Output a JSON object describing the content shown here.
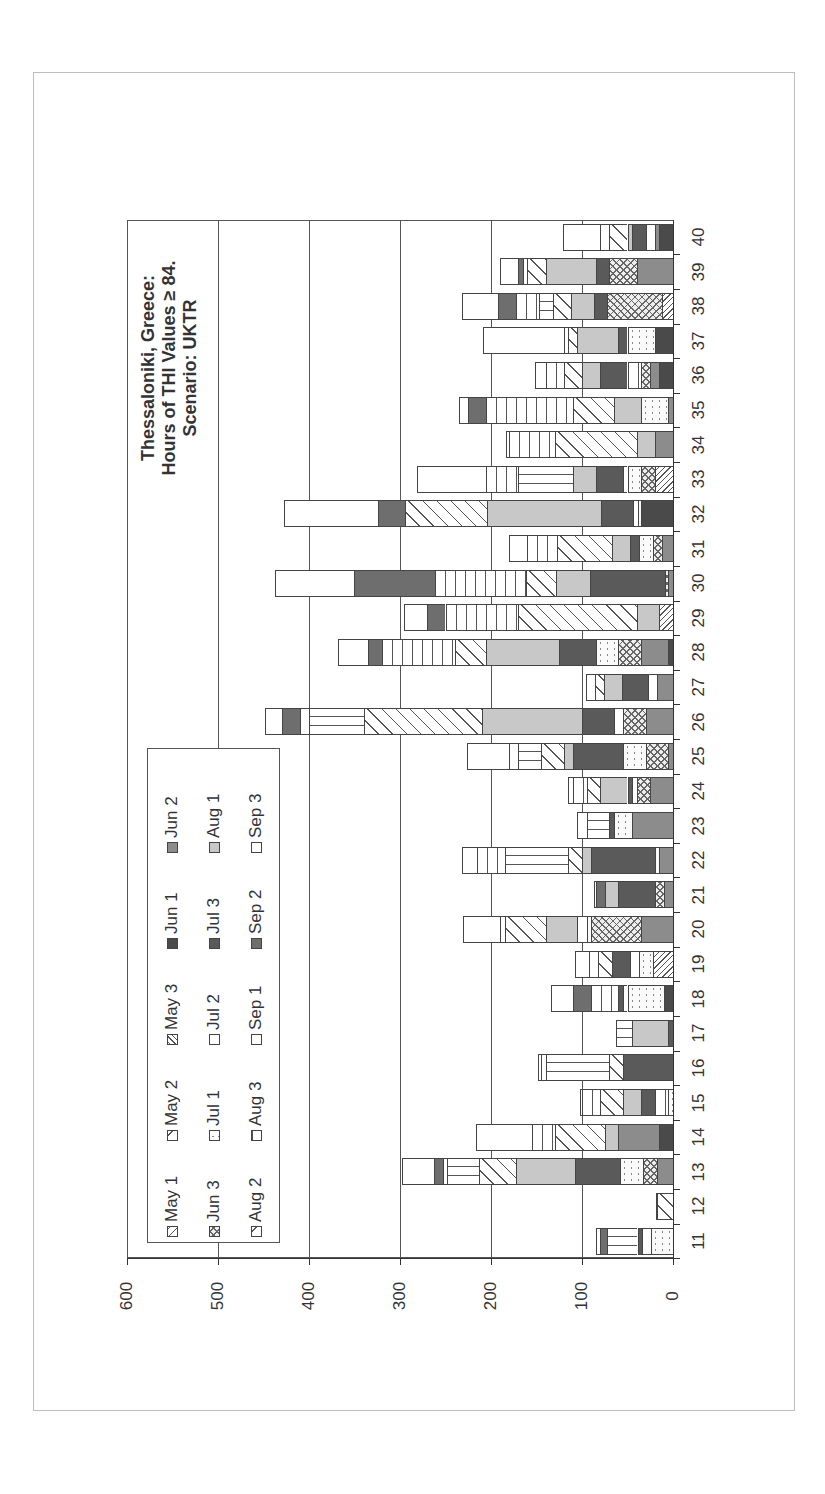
{
  "chart_data": {
    "type": "bar",
    "orientation": "stacked bar, page rotated 90° counter-clockwise",
    "title": "Thessaloniki, Greece: Hours of THI Values ≥ 84. Scenario: UKTR",
    "title_lines": [
      "Thessaloniki, Greece:",
      "Hours of THI Values ≥ 84.",
      "Scenario: UKTR"
    ],
    "xlabel": "",
    "ylabel": "",
    "ylim": [
      0,
      600
    ],
    "yticks": [
      0,
      100,
      200,
      300,
      400,
      500,
      600
    ],
    "grid": true,
    "legend_position": "inside plot area, lower-left (rotated)",
    "categories": [
      "11",
      "12",
      "13",
      "14",
      "15",
      "16",
      "17",
      "18",
      "19",
      "20",
      "21",
      "22",
      "23",
      "24",
      "25",
      "26",
      "27",
      "28",
      "29",
      "30",
      "31",
      "32",
      "33",
      "34",
      "35",
      "36",
      "37",
      "38",
      "39",
      "40"
    ],
    "totals": [
      85,
      19,
      298,
      216,
      102,
      148,
      63,
      134,
      86,
      231,
      87,
      232,
      105,
      110,
      226,
      448,
      96,
      368,
      276,
      435,
      180,
      428,
      281,
      183,
      235,
      152,
      209,
      232,
      190,
      121
    ],
    "series_names": [
      "May 1",
      "May 2",
      "May 3",
      "Jun 1",
      "Jun 2",
      "Jun 3",
      "Jul 1",
      "Jul 2",
      "Jul 3",
      "Aug 1",
      "Aug 2",
      "Aug 3",
      "Sep 1",
      "Sep 2",
      "Sep 3"
    ],
    "series": [
      {
        "name": "May 1",
        "pattern": "diagR",
        "values": [
          0,
          0,
          0,
          0,
          0,
          0,
          0,
          0,
          0,
          0,
          0,
          0,
          0,
          0,
          0,
          0,
          0,
          0,
          0,
          0,
          0,
          0,
          0,
          0,
          0,
          0,
          0,
          0,
          0,
          0
        ]
      },
      {
        "name": "May 2",
        "pattern": "diagR2",
        "values": [
          0,
          18,
          0,
          0,
          0,
          0,
          0,
          0,
          0,
          0,
          0,
          0,
          0,
          0,
          0,
          0,
          0,
          0,
          0,
          0,
          0,
          0,
          0,
          0,
          0,
          0,
          0,
          0,
          0,
          0
        ]
      },
      {
        "name": "May 3",
        "pattern": "diagL",
        "values": [
          0,
          0,
          0,
          0,
          0,
          0,
          0,
          0,
          22,
          0,
          0,
          0,
          0,
          0,
          0,
          0,
          0,
          0,
          15,
          0,
          0,
          0,
          20,
          0,
          0,
          0,
          0,
          12,
          0,
          0
        ]
      },
      {
        "name": "Jun 1",
        "pattern": "dark",
        "values": [
          0,
          0,
          0,
          15,
          0,
          0,
          0,
          10,
          0,
          0,
          0,
          0,
          0,
          0,
          0,
          0,
          0,
          5,
          0,
          0,
          0,
          35,
          0,
          0,
          0,
          15,
          20,
          0,
          0,
          15
        ]
      },
      {
        "name": "Jun 2",
        "pattern": "gray",
        "values": [
          0,
          0,
          18,
          45,
          0,
          0,
          0,
          0,
          0,
          35,
          10,
          15,
          45,
          25,
          5,
          30,
          18,
          30,
          0,
          5,
          12,
          0,
          0,
          20,
          5,
          10,
          0,
          0,
          40,
          5
        ]
      },
      {
        "name": "Jun 3",
        "pattern": "cross",
        "values": [
          0,
          0,
          15,
          0,
          0,
          0,
          0,
          0,
          0,
          55,
          10,
          0,
          0,
          15,
          25,
          25,
          0,
          25,
          0,
          4,
          10,
          0,
          15,
          0,
          0,
          10,
          0,
          60,
          30,
          0
        ]
      },
      {
        "name": "Jul 1",
        "pattern": "dots",
        "values": [
          24,
          0,
          25,
          0,
          5,
          0,
          0,
          40,
          15,
          5,
          0,
          5,
          20,
          0,
          25,
          0,
          0,
          25,
          0,
          0,
          15,
          4,
          15,
          0,
          30,
          0,
          30,
          0,
          0,
          0
        ]
      },
      {
        "name": "Jul 2",
        "pattern": "vert",
        "values": [
          10,
          0,
          0,
          0,
          15,
          0,
          0,
          5,
          10,
          10,
          0,
          0,
          0,
          5,
          0,
          10,
          10,
          0,
          0,
          0,
          0,
          5,
          5,
          0,
          0,
          15,
          0,
          0,
          0,
          10
        ]
      },
      {
        "name": "Jul 3",
        "pattern": "darkgray",
        "values": [
          5,
          0,
          50,
          0,
          15,
          55,
          5,
          5,
          20,
          0,
          40,
          70,
          5,
          5,
          55,
          35,
          28,
          40,
          0,
          82,
          10,
          35,
          30,
          0,
          0,
          30,
          10,
          15,
          15,
          15
        ]
      },
      {
        "name": "Aug 1",
        "pattern": "light",
        "values": [
          0,
          0,
          65,
          15,
          20,
          0,
          40,
          0,
          0,
          35,
          15,
          10,
          0,
          30,
          10,
          110,
          20,
          80,
          25,
          38,
          20,
          125,
          25,
          20,
          30,
          20,
          45,
          25,
          55,
          5
        ]
      },
      {
        "name": "Aug 2",
        "pattern": "diagR2",
        "values": [
          0,
          0,
          40,
          55,
          25,
          15,
          0,
          0,
          15,
          45,
          0,
          15,
          0,
          15,
          25,
          130,
          10,
          35,
          130,
          33,
          60,
          90,
          0,
          90,
          45,
          20,
          10,
          20,
          20,
          20
        ]
      },
      {
        "name": "Aug 3",
        "pattern": "horiz",
        "values": [
          33,
          0,
          35,
          0,
          0,
          70,
          18,
          0,
          0,
          0,
          0,
          70,
          25,
          0,
          25,
          60,
          0,
          0,
          0,
          0,
          0,
          0,
          60,
          0,
          0,
          0,
          0,
          15,
          0,
          0
        ]
      },
      {
        "name": "Sep 1",
        "pattern": "vert",
        "values": [
          0,
          0,
          5,
          25,
          20,
          5,
          0,
          30,
          10,
          5,
          0,
          30,
          10,
          15,
          10,
          10,
          10,
          80,
          80,
          100,
          33,
          0,
          35,
          50,
          95,
          20,
          5,
          25,
          5,
          10
        ]
      },
      {
        "name": "Sep 2",
        "pattern": "darkgray2",
        "values": [
          8,
          0,
          10,
          0,
          0,
          0,
          0,
          20,
          0,
          0,
          10,
          0,
          0,
          0,
          0,
          20,
          0,
          15,
          20,
          89,
          0,
          30,
          0,
          0,
          20,
          0,
          0,
          20,
          5,
          0
        ]
      },
      {
        "name": "Sep 3",
        "pattern": "white",
        "values": [
          5,
          1,
          35,
          61,
          2,
          3,
          0,
          24,
          16,
          41,
          2,
          17,
          0,
          5,
          46,
          18,
          0,
          33,
          26,
          86,
          20,
          104,
          76,
          3,
          10,
          12,
          89,
          40,
          20,
          41
        ]
      }
    ],
    "legend": [
      [
        "May 1",
        "May 2",
        "May 3",
        "Jun 1",
        "Jun 2"
      ],
      [
        "Jun 3",
        "Jul 1",
        "Jul 2",
        "Jul 3",
        "Aug 1"
      ],
      [
        "Aug 2",
        "Aug 3",
        "Sep 1",
        "Sep 2",
        "Sep 3"
      ]
    ]
  },
  "axis": {
    "ticks": [
      "0",
      "100",
      "200",
      "300",
      "400",
      "500",
      "600"
    ]
  }
}
